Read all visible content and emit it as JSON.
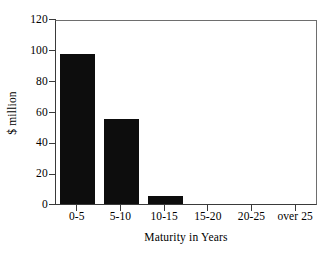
{
  "chart_data": {
    "type": "bar",
    "title": "",
    "xlabel": "Maturity in Years",
    "ylabel": "$ million",
    "categories": [
      "0-5",
      "5-10",
      "10-15",
      "15-20",
      "20-25",
      "over 25"
    ],
    "values": [
      97,
      55,
      5,
      0,
      0,
      0
    ],
    "series": [
      {
        "name": "$ million",
        "values": [
          97,
          55,
          5,
          0,
          0,
          0
        ]
      }
    ],
    "ylim": [
      0,
      120
    ],
    "yticks": [
      0,
      20,
      40,
      60,
      80,
      100,
      120
    ],
    "ytick_labels": [
      "0",
      "20",
      "40",
      "60",
      "80",
      "100",
      "120"
    ],
    "grid": false,
    "legend": false,
    "legend_position": "none",
    "bar_color": "#0d0d0d",
    "axis_color": "#3a3a3a",
    "background_color": "#ffffff"
  }
}
